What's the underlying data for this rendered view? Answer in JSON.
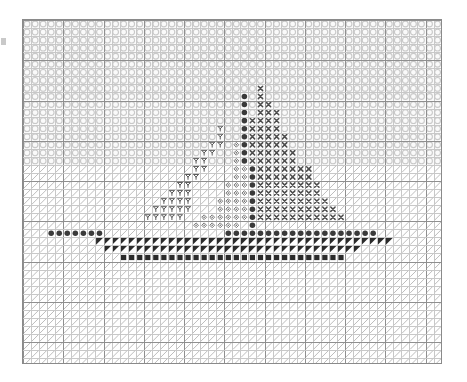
{
  "document": {
    "type": "cross-stitch-pattern-chart",
    "subject": "sailboat",
    "title": "",
    "background_color": "#ffffff",
    "frame_color": "#8a8a8a"
  },
  "grid": {
    "columns": 52,
    "rows": 43,
    "cell_size_px": 8.05,
    "origin_x_px": 23,
    "origin_y_px": 20,
    "minor_line_color": "#c8c8c8",
    "major_line_color": "#8f8f8f",
    "major_line_every": 5
  },
  "legend": {
    "symbols": [
      {
        "key": "O",
        "name": "open-circle",
        "glyph": "○",
        "color": "#c9c9c9",
        "meaning": "sky"
      },
      {
        "key": "/",
        "name": "diagonal-slash",
        "glyph": "╱",
        "color": "#b4b4b4",
        "meaning": "water"
      },
      {
        "key": "#",
        "name": "filled-circle",
        "glyph": "●",
        "color": "#3a3a3a",
        "meaning": "mast-and-gunwale"
      },
      {
        "key": "X",
        "name": "cross",
        "glyph": "✕",
        "color": "#4a4a4a",
        "meaning": "right-sail"
      },
      {
        "key": "Y",
        "name": "y-stitch",
        "glyph": "Υ",
        "color": "#5a5a5a",
        "meaning": "left-sail"
      },
      {
        "key": "D",
        "name": "diamond",
        "glyph": "◇",
        "color": "#6a6a6a",
        "meaning": "inner-sail"
      },
      {
        "key": "T",
        "name": "filled-triangle",
        "glyph": "◤",
        "color": "#2b2b2b",
        "meaning": "hull"
      },
      {
        "key": "S",
        "name": "filled-square",
        "glyph": "■",
        "color": "#2b2b2b",
        "meaning": "keel"
      }
    ]
  },
  "chart_data": {
    "type": "heatmap",
    "xlabel": "",
    "ylabel": "",
    "columns": 52,
    "rows": 43,
    "water_line_row": 18,
    "cells": [
      "OOOOOOOOOOOOOOOOOOOOOOOOOOOOOOOOOOOOOOOOOOOOOOOOOOOO",
      "OOOOOOOOOOOOOOOOOOOOOOOOOOOOOOOOOOOOOOOOOOOOOOOOOOOO",
      "OOOOOOOOOOOOOOOOOOOOOOOOOOOOOOOOOOOOOOOOOOOOOOOOOOOO",
      "OOOOOOOOOOOOOOOOOOOOOOOOOOOOOOOOOOOOOOOOOOOOOOOOOOOO",
      "OOOOOOOOOOOOOOOOOOOOOOOOOOOOOOOOOOOOOOOOOOOOOOOOOOOO",
      "OOOOOOOOOOOOOOOOOOOOOOOOOOOOOOOOOOOOOOOOOOOOOOOOOOOO",
      "OOOOOOOOOOOOOOOOOOOOOOOOOOOOOOOOOOOOOOOOOOOOOOOOOOOO",
      "OOOOOOOOOOOOOOOOOOOOOOOOOOOOOOOOOOOOOOOOOOOOOOOOOOOO",
      "OOOOOOOOOOOOOOOOOOOOOOOOOOOOOXOOOOOOOOOOOOOOOOOOOOOO",
      "OOOOOOOOOOOOOOOOOOOOOOOOOOO#OXOOOOOOOOOOOOOOOOOOOOOO",
      "OOOOOOOOOOOOOOOOOOOOOOOOOOO#OXXOOOOOOOOOOOOOOOOOOOOO",
      "OOOOOOOOOOOOOOOOOOOOOOOOOOO#OXXXOOOOOOOOOOOOOOOOOOOO",
      "OOOOOOOOOOOOOOOOOOOOOOOOOOO#XXXXOOOOOOOOOOOOOOOOOOOO",
      "OOOOOOOOOOOOOOOOOOOOOOOOYOO#XXXXOOOOOOOOOOOOOOOOOOOO",
      "OOOOOOOOOOOOOOOOOOOOOOOOYOO#XXXXXOOOOOOOOOOOOOOOOOOO",
      "OOOOOOOOOOOOOOOOOOOOOOOYYOD#XXXXXOOOOOOOOOOOOOOOOOOO",
      "OOOOOOOOOOOOOOOOOOOOOOYYOOD#XXXXXXOOOOOOOOOOOOOOOOOO",
      "OOOOOOOOOOOOOOOOOOOOOYYOOOD#XXXXXXOOOOOOOOOOOOOOOOOO",
      "/////////////////////YY///DD#XXXXXXX////////////////",
      "////////////////////YY////DD#XXXXXXX////////////////",
      "///////////////////YY////DDD#XXXXXXXX///////////////",
      "//////////////////YYY////DDD#XXXXXXXX///////////////",
      "/////////////////YYYY///DDDD#XXXXXXXXX//////////////",
      "////////////////YYYYY///DDDD#XXXXXXXXXX/////////////",
      "///////////////YYYYY//DDDDDD#XXXXXXXXXXX////////////",
      "/////////////////////DDDDDD/#///////////////////////",
      "///#######///////////////###################////////",
      "/////////TTTTTTTTTTTTTTTTTTTTTTTTTTTTTTTTTTTTT//////",
      "//////////TTTTTTTTTTTTTTTTTTTTTTTTTTTTTTTT/////////",
      "////////////SSSSSSSSSSSSSSSSSSSSSSSSSSSS///////////",
      "////////////////////////////////////////////////////",
      "////////////////////////////////////////////////////",
      "////////////////////////////////////////////////////",
      "////////////////////////////////////////////////////",
      "////////////////////////////////////////////////////",
      "////////////////////////////////////////////////////",
      "////////////////////////////////////////////////////",
      "////////////////////////////////////////////////////",
      "////////////////////////////////////////////////////",
      "////////////////////////////////////////////////////",
      "////////////////////////////////////////////////////",
      "////////////////////////////////////////////////////",
      "////////////////////////////////////////////////////"
    ]
  }
}
